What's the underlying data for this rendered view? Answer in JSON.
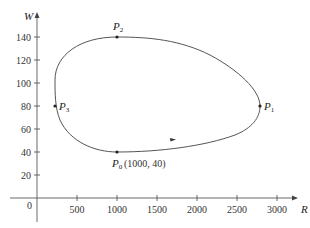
{
  "chart_data": {
    "type": "line",
    "title": "",
    "xlabel": "R",
    "ylabel": "W",
    "xlim": [
      0,
      3200
    ],
    "ylim": [
      0,
      150
    ],
    "x_ticks": [
      500,
      1000,
      1500,
      2000,
      2500,
      3000
    ],
    "y_ticks": [
      20,
      40,
      60,
      80,
      100,
      120,
      140
    ],
    "origin_label": "0",
    "grid": false,
    "legend": null,
    "series": [
      {
        "name": "phase trajectory (closed curve)",
        "points": [
          {
            "x": 1000,
            "y": 40
          },
          {
            "x": 2200,
            "y": 50
          },
          {
            "x": 2800,
            "y": 80
          },
          {
            "x": 1700,
            "y": 130
          },
          {
            "x": 1000,
            "y": 140
          },
          {
            "x": 250,
            "y": 80
          },
          {
            "x": 1000,
            "y": 40
          }
        ]
      }
    ],
    "annotations": [
      {
        "label": "P0",
        "text": "P₀(1000, 40)",
        "x": 1000,
        "y": 40
      },
      {
        "label": "P1",
        "text": "P₁",
        "x": 2800,
        "y": 80
      },
      {
        "label": "P2",
        "text": "P₂",
        "x": 1000,
        "y": 140
      },
      {
        "label": "P3",
        "text": "P₃",
        "x": 250,
        "y": 80
      }
    ]
  },
  "labels": {
    "x_axis": "R",
    "y_axis": "W",
    "origin": "0",
    "p0": "(1000, 40)",
    "x_ticks": [
      "500",
      "1000",
      "1500",
      "2000",
      "2500",
      "3000"
    ],
    "y_ticks": [
      "20",
      "40",
      "60",
      "80",
      "100",
      "120",
      "140"
    ]
  }
}
